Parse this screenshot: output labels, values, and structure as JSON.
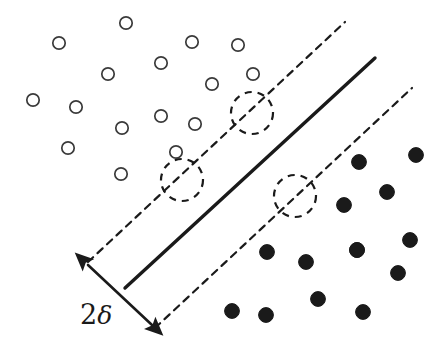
{
  "figure": {
    "background_color": "#ffffff",
    "ink_color": "#1a1a1a"
  },
  "annotations": {
    "margin_label": "2δ",
    "margin_label_main": "2",
    "margin_label_symbol": "δ",
    "margin_label_position": {
      "x": 80,
      "y": 324
    }
  },
  "chart_data": {
    "type": "scatter",
    "title": "",
    "xlabel": "",
    "ylabel": "",
    "xlim": [
      0,
      445
    ],
    "ylim": [
      0,
      347
    ],
    "grid": false,
    "legend": false,
    "note": "Pixel coordinates, y increases downward, matching the source screenshot.",
    "series": [
      {
        "name": "class-open",
        "marker": "open-circle",
        "fill": "#ffffff",
        "stroke": "#3a3a3a",
        "radius": 6.2,
        "points": [
          {
            "x": 126,
            "y": 23
          },
          {
            "x": 59,
            "y": 43
          },
          {
            "x": 192,
            "y": 42
          },
          {
            "x": 238,
            "y": 45
          },
          {
            "x": 161,
            "y": 63
          },
          {
            "x": 108,
            "y": 74
          },
          {
            "x": 253,
            "y": 74
          },
          {
            "x": 33,
            "y": 100
          },
          {
            "x": 76,
            "y": 107
          },
          {
            "x": 212,
            "y": 84
          },
          {
            "x": 161,
            "y": 116
          },
          {
            "x": 195,
            "y": 124
          },
          {
            "x": 122,
            "y": 128
          },
          {
            "x": 68,
            "y": 148
          },
          {
            "x": 176,
            "y": 152
          },
          {
            "x": 121,
            "y": 174
          }
        ]
      },
      {
        "name": "class-filled",
        "marker": "filled-circle",
        "fill": "#1a1a1a",
        "stroke": "#1a1a1a",
        "radius": 7.4,
        "points": [
          {
            "x": 359,
            "y": 162
          },
          {
            "x": 416,
            "y": 155
          },
          {
            "x": 387,
            "y": 192
          },
          {
            "x": 344,
            "y": 205
          },
          {
            "x": 410,
            "y": 240
          },
          {
            "x": 357,
            "y": 250
          },
          {
            "x": 267,
            "y": 252
          },
          {
            "x": 306,
            "y": 262
          },
          {
            "x": 357,
            "y": 250
          },
          {
            "x": 398,
            "y": 273
          },
          {
            "x": 318,
            "y": 299
          },
          {
            "x": 232,
            "y": 311
          },
          {
            "x": 266,
            "y": 315
          },
          {
            "x": 363,
            "y": 312
          }
        ]
      },
      {
        "name": "support-vectors",
        "marker": "highlighted",
        "points": [
          {
            "x": 252,
            "y": 113,
            "class": "class-open"
          },
          {
            "x": 182,
            "y": 180,
            "class": "class-open"
          },
          {
            "x": 295,
            "y": 196,
            "class": "class-filled"
          }
        ],
        "highlight_radius": 21,
        "highlight_style": "dashed-circle"
      }
    ],
    "lines": [
      {
        "name": "decision-boundary",
        "style": "solid",
        "width": 3.4,
        "color": "#1a1a1a",
        "x1": 125,
        "y1": 288,
        "x2": 375,
        "y2": 58
      },
      {
        "name": "margin-boundary-upper",
        "style": "dashed",
        "width": 2.2,
        "color": "#1a1a1a",
        "x1": 88,
        "y1": 262,
        "x2": 345,
        "y2": 22
      },
      {
        "name": "margin-boundary-lower",
        "style": "dashed",
        "width": 2.2,
        "color": "#1a1a1a",
        "x1": 155,
        "y1": 328,
        "x2": 412,
        "y2": 88
      },
      {
        "name": "margin-width-arrow",
        "style": "solid-double-arrow",
        "width": 2.6,
        "color": "#1a1a1a",
        "x1": 88,
        "y1": 265,
        "x2": 152,
        "y2": 325
      }
    ]
  }
}
